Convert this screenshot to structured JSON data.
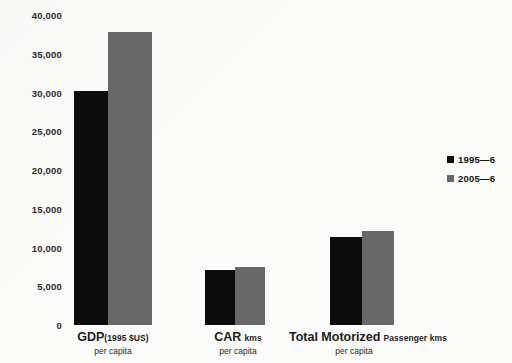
{
  "chart_data": {
    "type": "bar",
    "title": "",
    "xlabel": "",
    "ylabel": "",
    "ylim": [
      0,
      40000
    ],
    "ytick_step": 5000,
    "grid": false,
    "legend_position": "right",
    "categories": [
      "GDP (1995 $US) per capita",
      "CAR kms per capita",
      "Total Motorized Passenger kms per capita"
    ],
    "series": [
      {
        "name": "1995—6",
        "color": "#0c0c0c",
        "values": [
          30200,
          7100,
          11400
        ]
      },
      {
        "name": "2005—6",
        "color": "#686868",
        "values": [
          37800,
          7500,
          12100
        ]
      }
    ],
    "ytick_labels": [
      "40,000",
      "35,000",
      "30,000",
      "25,000",
      "20,000",
      "15,000",
      "10,000",
      "5,000",
      "0"
    ],
    "ytick_values": [
      40000,
      35000,
      30000,
      25000,
      20000,
      15000,
      10000,
      5000,
      0
    ]
  },
  "axis": {
    "ticks": [
      {
        "label": "40,000",
        "value": 40000
      },
      {
        "label": "35,000",
        "value": 35000
      },
      {
        "label": "30,000",
        "value": 30000
      },
      {
        "label": "25,000",
        "value": 25000
      },
      {
        "label": "20,000",
        "value": 20000
      },
      {
        "label": "15,000",
        "value": 15000
      },
      {
        "label": "10,000",
        "value": 10000
      },
      {
        "label": "5,000",
        "value": 5000
      },
      {
        "label": "0",
        "value": 0
      }
    ]
  },
  "groups": [
    {
      "main": "GDP",
      "unit": "(1995 $US)",
      "sub": "per capita",
      "center_x": 113
    },
    {
      "main": "CAR",
      "unit": "kms",
      "sub": "per capita",
      "center_x": 238
    },
    {
      "main": "Total Motorized",
      "unit": "Passenger kms",
      "sub": "per capita",
      "center_x": 363
    }
  ],
  "legend": {
    "items": [
      {
        "label": "1995—6",
        "color": "#0c0c0c"
      },
      {
        "label": "2005—6",
        "color": "#686868"
      }
    ]
  },
  "colors": {
    "series_1995": "#0c0c0c",
    "series_2005": "#686868",
    "background": "#fbfbfa",
    "text": "#1d1d1d"
  }
}
